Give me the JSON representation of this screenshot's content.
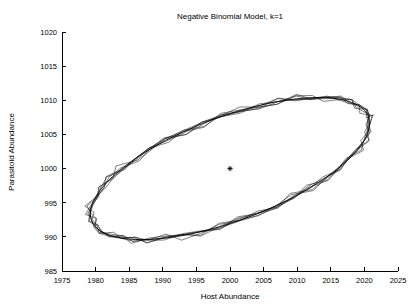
{
  "chart_data": {
    "type": "line",
    "title": "Negative Binomial Model, k=1",
    "xlabel": "Host Abundance",
    "ylabel": "Parasitoid Abundance",
    "xlim": [
      1975,
      2025
    ],
    "ylim": [
      985,
      1020
    ],
    "xticks": [
      1975,
      1980,
      1985,
      1990,
      1995,
      2000,
      2005,
      2010,
      2015,
      2020,
      2025
    ],
    "yticks": [
      985,
      990,
      995,
      1000,
      1005,
      1010,
      1015,
      1020
    ],
    "grid": false,
    "legend": null,
    "line_color": "#000000",
    "background_color": "#ffffff",
    "equilibrium_marker": {
      "label": "equilibrium-point",
      "symbol": "*",
      "x": 2000,
      "y": 1000
    },
    "cycle": {
      "center_x": 2000,
      "center_y": 1000,
      "semi_major_x": 22.0,
      "semi_minor_y": 7.6,
      "rotation_deg": -20.5,
      "x_min": 1978,
      "x_max": 2022,
      "y_min": 985.2,
      "y_max": 1015.4,
      "n_traces": 6,
      "jitter_amplitude": 1.1,
      "jitter_lobes": 13
    },
    "series": [
      {
        "name": "host-parasitoid trajectory",
        "x": [
          2000.0,
          2006.4,
          2012.0,
          2016.4,
          2019.4,
          2021.2,
          2021.6,
          2020.6,
          2018.4,
          2015.0,
          2010.6,
          2005.6,
          2000.2,
          1994.6,
          1989.4,
          1985.0,
          1981.6,
          1979.4,
          1978.4,
          1978.8,
          1980.6,
          1983.6,
          1987.6,
          1992.4,
          1997.2,
          2000.0
        ],
        "y": [
          1010.8,
          1013.6,
          1015.0,
          1014.8,
          1013.2,
          1010.4,
          1006.8,
          1002.8,
          998.6,
          994.4,
          990.6,
          987.6,
          985.6,
          985.2,
          986.2,
          988.4,
          991.6,
          995.4,
          999.4,
          1003.2,
          1006.6,
          1009.4,
          1011.4,
          1012.6,
          1012.4,
          1010.8
        ]
      }
    ]
  },
  "figure": {
    "title_text": "Negative Binomial Model, k=1",
    "x_axis_title": "Host Abundance",
    "y_axis_title": "Parasitoid Abundance",
    "x_tick_labels": [
      "1975",
      "1980",
      "1985",
      "1990",
      "1995",
      "2000",
      "2005",
      "2010",
      "2015",
      "2020",
      "2025"
    ],
    "y_tick_labels": [
      "985",
      "990",
      "995",
      "1000",
      "1005",
      "1010",
      "1015",
      "1020"
    ]
  }
}
